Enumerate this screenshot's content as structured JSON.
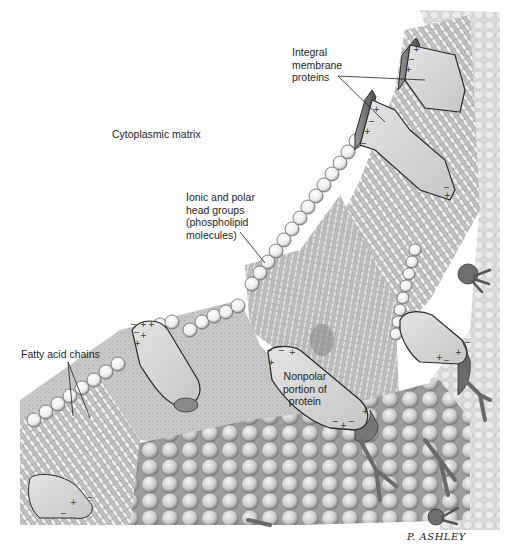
{
  "diagram": {
    "style": "grayscale pencil illustration",
    "labels": {
      "integral_proteins": "Integral\nmembrane\nproteins",
      "cytoplasmic_matrix": "Cytoplasmic matrix",
      "head_groups": "Ionic and polar\nhead groups\n(phospholipid\nmolecules)",
      "fatty_acid_chains": "Fatty acid chains",
      "nonpolar_portion": "Nonpolar\nportion of\nprotein"
    },
    "signature": "P. ASHLEY",
    "charge_symbols": [
      "+",
      "−"
    ],
    "colors": {
      "background": "#ffffff",
      "head_group": "#f2f2f2",
      "head_outline": "#555555",
      "protein_fill": "#d9d9d9",
      "protein_outline": "#2a2a2a",
      "membrane_interior": "#bdbdbd",
      "shadow": "#6e6e6e",
      "leader_line": "#1e1e1e"
    }
  }
}
